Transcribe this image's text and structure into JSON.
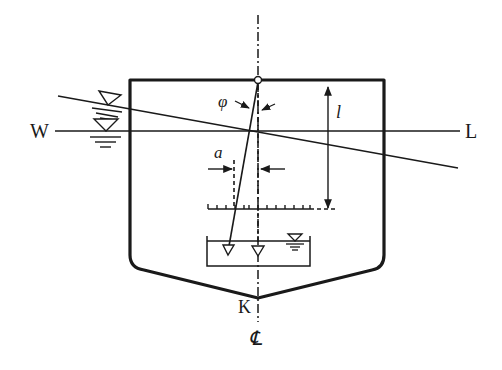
{
  "diagram": {
    "labels": {
      "waterline_left": "W",
      "waterline_right": "L",
      "keel": "K",
      "centerline": "℄",
      "heel_angle": "φ",
      "deflection": "a",
      "pendulum_length": "l"
    },
    "colors": {
      "line": "#1a1a1a",
      "background": "#ffffff"
    },
    "components": [
      "hull-section",
      "centerline",
      "upright-waterline",
      "inclined-waterline",
      "pendulum",
      "graduated-scale",
      "damping-tank",
      "water-level-symbols"
    ]
  }
}
